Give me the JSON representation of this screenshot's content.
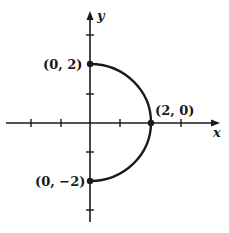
{
  "diagram": {
    "type": "coordinate-plane-semicircle",
    "axes": {
      "x_label": "x",
      "y_label": "y",
      "x_ticks": [
        -3,
        -2,
        -1,
        1,
        2,
        3
      ],
      "y_ticks": [
        -3,
        -2,
        -1,
        1,
        2,
        3
      ]
    },
    "curve": {
      "description": "right half of circle x^2 + y^2 = 4",
      "center": [
        0,
        0
      ],
      "radius": 2,
      "from": [
        0,
        2
      ],
      "to": [
        0,
        -2
      ],
      "color": "#1a1a1a"
    },
    "points": [
      {
        "label": "(0, 2)",
        "x": 0,
        "y": 2
      },
      {
        "label": "(2, 0)",
        "x": 2,
        "y": 0
      },
      {
        "label": "(0, −2)",
        "x": 0,
        "y": -2
      }
    ]
  }
}
